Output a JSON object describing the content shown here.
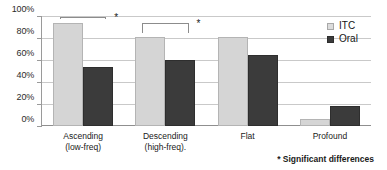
{
  "chart_data": {
    "type": "bar",
    "title": "",
    "xlabel": "",
    "ylabel": "",
    "ylim": [
      0,
      100
    ],
    "ytick_labels": [
      "100%",
      "80%",
      "60%",
      "40%",
      "20%",
      "0%"
    ],
    "ytick_values": [
      100,
      80,
      60,
      40,
      20,
      0
    ],
    "grid": true,
    "legend_position": "top-right",
    "categories": [
      "Ascending (low-freq)",
      "Descending (high-freq).",
      "Flat",
      "Profound"
    ],
    "category_lines": [
      {
        "line1": "Ascending",
        "line2": "(low-freq)"
      },
      {
        "line1": "Descending",
        "line2": "(high-freq)."
      },
      {
        "line1": "Flat",
        "line2": ""
      },
      {
        "line1": "Profound",
        "line2": ""
      }
    ],
    "series": [
      {
        "name": "ITC",
        "color": "#d5d5d5",
        "values": [
          94,
          81,
          81,
          6
        ]
      },
      {
        "name": "Oral",
        "color": "#3b3b3b",
        "values": [
          54,
          60,
          65,
          18
        ]
      }
    ],
    "annotations": [
      {
        "label": "*",
        "category": "Ascending (low-freq)",
        "meaning": "Significant differences"
      },
      {
        "label": "*",
        "category": "Descending (high-freq).",
        "meaning": "Significant differences"
      }
    ],
    "footnote": "* Significant differences"
  },
  "legend": {
    "items": [
      {
        "label": "ITC"
      },
      {
        "label": "Oral"
      }
    ]
  }
}
